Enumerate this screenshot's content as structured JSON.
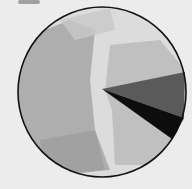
{
  "figure": {
    "kind": "hand-drawn circle with wedge",
    "colors": {
      "background": "#ececec",
      "circle_outline": "#111111",
      "wash_left": "#a9a9a9",
      "wash_right": "#bdbdbd",
      "wedge_upper": "#5a5a5a",
      "wedge_lower": "#0d0d0d"
    }
  }
}
